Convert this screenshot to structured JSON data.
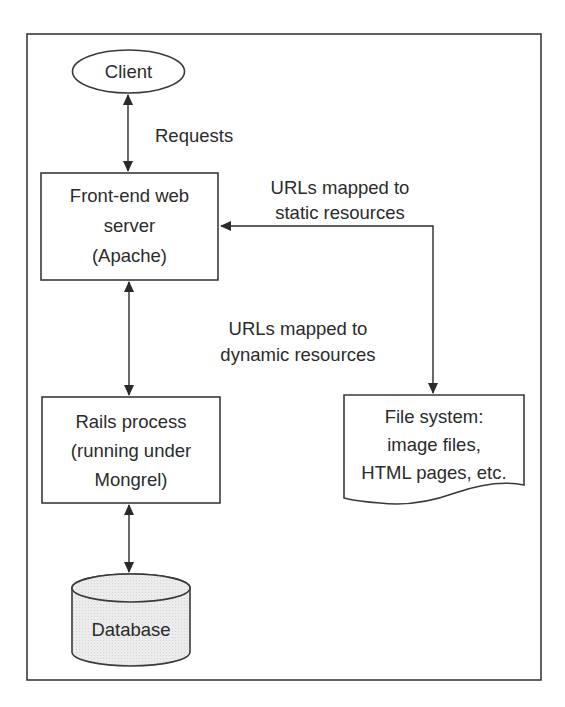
{
  "diagram": {
    "colors": {
      "stroke": "#3a3a3a",
      "text": "#2b2b2b",
      "background": "#ffffff",
      "database_fill": "#ebebeb"
    },
    "nodes": {
      "client": {
        "shape": "ellipse",
        "lines": [
          "Client"
        ]
      },
      "web_server": {
        "shape": "rectangle",
        "lines": [
          "Front-end web",
          "server",
          "(Apache)"
        ]
      },
      "rails": {
        "shape": "rectangle",
        "lines": [
          "Rails process",
          "(running under",
          "Mongrel)"
        ]
      },
      "file_system": {
        "shape": "document",
        "lines": [
          "File system:",
          "image files,",
          "HTML pages, etc."
        ]
      },
      "database": {
        "shape": "cylinder",
        "lines": [
          "Database"
        ]
      }
    },
    "edges": [
      {
        "id": "client-web",
        "from": "client",
        "to": "web_server",
        "direction": "bidirectional",
        "label_lines": [
          "Requests"
        ]
      },
      {
        "id": "web-filesystem",
        "from": "web_server",
        "to": "file_system",
        "direction": "bidirectional",
        "label_lines": [
          "URLs mapped to",
          "static resources"
        ]
      },
      {
        "id": "web-rails",
        "from": "web_server",
        "to": "rails",
        "direction": "bidirectional",
        "label_lines": [
          "URLs mapped to",
          "dynamic resources"
        ]
      },
      {
        "id": "rails-db",
        "from": "rails",
        "to": "database",
        "direction": "bidirectional",
        "label_lines": []
      }
    ]
  }
}
